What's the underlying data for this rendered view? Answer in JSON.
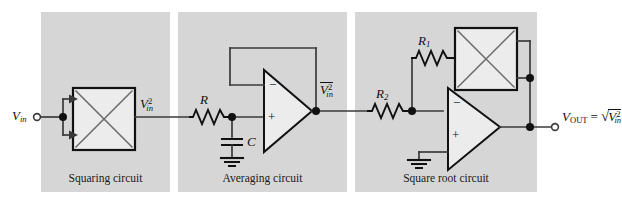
{
  "figure": {
    "background_color": "#ffffff",
    "panel_color": "#d6d6d6",
    "line_color": "#3a3a3a",
    "node_color": "#111111"
  },
  "panels": [
    {
      "id": "squaring",
      "caption": "Squaring circuit"
    },
    {
      "id": "averaging",
      "caption": "Averaging circuit"
    },
    {
      "id": "squareroot",
      "caption": "Square root circuit"
    }
  ],
  "labels": {
    "v_in": {
      "base": "V",
      "sub": "in"
    },
    "v_in_squared": {
      "base": "V",
      "sub": "in",
      "sup": "2"
    },
    "v_in_squared_avg": {
      "base": "V",
      "sub": "in",
      "sup": "2",
      "overbar": true
    },
    "resistor_r": "R",
    "resistor_r1": {
      "base": "R",
      "sub": "1"
    },
    "resistor_r2": {
      "base": "R",
      "sub": "2"
    },
    "capacitor_c": "C",
    "v_out": {
      "base": "V",
      "sub": "OUT"
    },
    "equals": "=",
    "radical": "√",
    "opamp_minus": "−",
    "opamp_plus": "+"
  },
  "components": {
    "multiplier_squaring": "multiplier-block",
    "multiplier_feedback": "multiplier-block",
    "opamp_averaging": "operational-amplifier",
    "opamp_squareroot": "operational-amplifier",
    "ground_averaging": "ground-symbol",
    "ground_squareroot": "ground-symbol",
    "terminal_input": "input-terminal",
    "terminal_output": "output-terminal"
  }
}
